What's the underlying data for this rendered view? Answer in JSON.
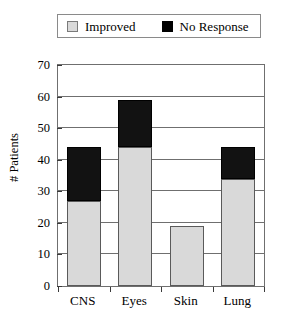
{
  "legend": {
    "entries": [
      {
        "label": "Improved",
        "swatch": "light-gray-square",
        "color": "#d9d9d9"
      },
      {
        "label": "No Response",
        "swatch": "black-square",
        "color": "#000000"
      }
    ]
  },
  "chart_data": {
    "type": "bar",
    "stacked": true,
    "title": "",
    "subtitle": "",
    "xlabel": "",
    "ylabel": "# Patients",
    "categories": [
      "CNS",
      "Eyes",
      "Skin",
      "Lung"
    ],
    "series": [
      {
        "name": "Improved",
        "color": "#d9d9d9",
        "values": [
          27,
          44,
          19,
          34
        ]
      },
      {
        "name": "No Response",
        "color": "#000000",
        "values": [
          17,
          15,
          0,
          10
        ]
      }
    ],
    "totals": [
      44,
      59,
      19,
      44
    ],
    "ylim": [
      0,
      70
    ],
    "ytick_values": [
      0,
      10,
      20,
      30,
      40,
      50,
      60,
      70
    ],
    "ytick_labels": [
      "0",
      "10",
      "20",
      "30",
      "40",
      "50",
      "60",
      "70"
    ],
    "ytick_step": 10,
    "grid": true,
    "grid_axis": "y",
    "legend_position": "top"
  }
}
